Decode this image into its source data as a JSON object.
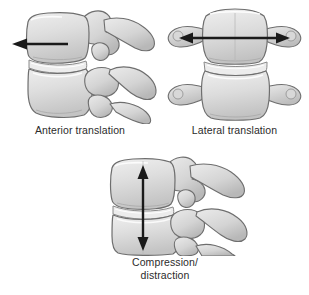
{
  "figure": {
    "background_color": "#ffffff",
    "panel_count": 3
  },
  "style": {
    "bone_fill_light": "#e6e6e6",
    "bone_fill_mid": "#d2d2d2",
    "bone_fill_dark": "#bcbcbc",
    "bone_outline": "#6b6b6b",
    "bone_shadow": "#9a9a9a",
    "disc_fill": "#ededed",
    "arrow_color": "#1a1a1a",
    "caption_color": "#2b2b2b"
  },
  "panels": [
    {
      "id": "anterior-translation",
      "caption": "Anterior translation",
      "view": "lateral view of two lumbar vertebrae with posterior elements",
      "arrow": {
        "name": "anterior-translation-arrow",
        "direction": "left",
        "heads": "single",
        "orientation": "horizontal"
      }
    },
    {
      "id": "lateral-translation",
      "caption": "Lateral translation",
      "view": "anterior view of two vertebral bodies with transverse processes",
      "arrow": {
        "name": "lateral-translation-arrow",
        "direction": "left-right",
        "heads": "double",
        "orientation": "horizontal"
      }
    },
    {
      "id": "compression-distraction",
      "caption": "Compression/\ndistraction",
      "view": "lateral view of two lumbar vertebrae with posterior elements",
      "arrow": {
        "name": "compression-distraction-arrow",
        "direction": "up-down",
        "heads": "double",
        "orientation": "vertical"
      }
    }
  ]
}
